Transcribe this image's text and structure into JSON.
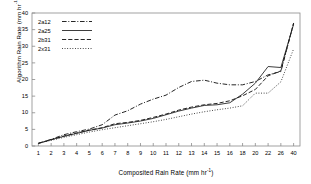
{
  "chart_data": {
    "type": "line",
    "title": "",
    "xlabel": "Composited Rain Rate (mm hr",
    "xlabel_sup": "-1",
    "xlabel_tail": ")",
    "ylabel": "Algorithm Rain Rate (mm hr",
    "ylabel_sup": "-1",
    "ylabel_tail": ")",
    "categories": [
      "1",
      "2",
      "3",
      "4",
      "5",
      "6",
      "7",
      "8",
      "9",
      "10",
      "11",
      "12",
      "13",
      "14",
      "15",
      "16",
      "18",
      "20",
      "22",
      "26",
      "40"
    ],
    "yticks": [
      "0",
      "5",
      "10",
      "15",
      "20",
      "25",
      "30",
      "35",
      "40"
    ],
    "ylim": [
      0,
      40
    ],
    "grid": false,
    "legend_position": "top-left-inside",
    "series": [
      {
        "name": "2a12",
        "style": "dash-dot",
        "color": "#1a1a1a",
        "values": [
          0.8,
          2.0,
          3.4,
          4.3,
          5.1,
          6.4,
          9.3,
          10.6,
          12.6,
          14.1,
          15.3,
          17.6,
          19.4,
          19.8,
          18.9,
          18.4,
          18.4,
          19.4,
          21.4,
          22.4,
          36.9
        ]
      },
      {
        "name": "2a25",
        "style": "solid",
        "color": "#333333",
        "values": [
          0.8,
          1.9,
          2.9,
          3.8,
          4.7,
          5.4,
          6.4,
          6.9,
          7.5,
          8.3,
          9.4,
          10.5,
          11.4,
          12.2,
          12.4,
          13.0,
          15.6,
          18.9,
          23.9,
          23.6,
          36.6
        ]
      },
      {
        "name": "2b31",
        "style": "dashed",
        "color": "#1a1a1a",
        "values": [
          0.8,
          1.9,
          3.0,
          3.9,
          4.8,
          5.5,
          6.7,
          7.1,
          7.7,
          8.6,
          9.6,
          10.8,
          11.7,
          12.4,
          12.8,
          13.6,
          15.1,
          17.0,
          21.1,
          22.6,
          37.0
        ]
      },
      {
        "name": "2x31",
        "style": "dotted",
        "color": "#2a2a2a",
        "values": [
          0.8,
          1.7,
          2.6,
          3.4,
          4.2,
          4.9,
          5.5,
          6.1,
          6.7,
          7.3,
          8.0,
          8.8,
          9.6,
          10.3,
          10.9,
          11.4,
          12.1,
          15.9,
          15.9,
          19.3,
          29.2
        ]
      }
    ]
  }
}
